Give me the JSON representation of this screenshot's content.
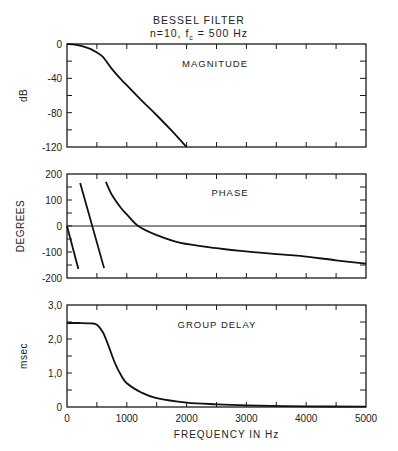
{
  "figure": {
    "title_line1": "BESSEL FILTER",
    "title_line2_prefix": "n=10,  f",
    "title_line2_sub": "c",
    "title_line2_suffix": " = 500 Hz",
    "xlabel": "FREQUENCY IN Hz"
  },
  "chart_data": [
    {
      "type": "line",
      "title": "MAGNITUDE",
      "xlabel": "FREQUENCY IN Hz",
      "ylabel": "dB",
      "xlim": [
        0,
        5000
      ],
      "ylim": [
        -120,
        0
      ],
      "x_ticks": [
        0,
        500,
        1000,
        1500,
        2000,
        2500,
        3000,
        3500,
        4000,
        4500,
        5000
      ],
      "y_tick_labels": [
        "0",
        "-40",
        "-80",
        "-120"
      ],
      "y_ticks": [
        0,
        -20,
        -40,
        -60,
        -80,
        -100,
        -120
      ],
      "grid": false,
      "series": [
        {
          "name": "Magnitude",
          "x": [
            0,
            100,
            250,
            400,
            500,
            600,
            750,
            900,
            1000,
            1250,
            1500,
            1750,
            2000
          ],
          "y": [
            0,
            -0.4,
            -2.5,
            -6,
            -10,
            -15,
            -29,
            -41,
            -48,
            -66,
            -83,
            -101,
            -120
          ]
        }
      ]
    },
    {
      "type": "line",
      "title": "PHASE",
      "ylabel": "DEGREES",
      "xlim": [
        0,
        5000
      ],
      "ylim": [
        -200,
        200
      ],
      "y_tick_labels": [
        "200",
        "100",
        "0",
        "-100",
        "-200"
      ],
      "y_ticks": [
        200,
        150,
        100,
        50,
        0,
        -50,
        -100,
        -150,
        -200
      ],
      "zero_line": true,
      "grid": false,
      "series": [
        {
          "name": "Phase segment 1",
          "x": [
            0,
            190
          ],
          "y": [
            0,
            -165
          ]
        },
        {
          "name": "Phase segment 2",
          "x": [
            220,
            620
          ],
          "y": [
            165,
            -162
          ]
        },
        {
          "name": "Phase segment 3",
          "x": [
            650,
            750,
            900,
            1000,
            1190,
            1500,
            1900,
            2500,
            2900,
            3500,
            3900,
            4500,
            5000
          ],
          "y": [
            170,
            120,
            70,
            45,
            0,
            -35,
            -65,
            -85,
            -96,
            -108,
            -115,
            -132,
            -145
          ]
        }
      ]
    },
    {
      "type": "line",
      "title": "GROUP DELAY",
      "ylabel": "msec",
      "xlabel": "FREQUENCY IN Hz",
      "xlim": [
        0,
        5000
      ],
      "ylim": [
        0,
        3.0
      ],
      "x_tick_labels": [
        "0",
        "1000",
        "2000",
        "3000",
        "4000",
        "5000"
      ],
      "y_tick_labels": [
        "3,0",
        "2,0",
        "1,0",
        "0"
      ],
      "y_ticks": [
        3.0,
        2.5,
        2.0,
        1.5,
        1.0,
        0.5,
        0
      ],
      "grid": false,
      "series": [
        {
          "name": "Group delay",
          "x": [
            0,
            200,
            400,
            500,
            600,
            690,
            800,
            900,
            1000,
            1250,
            1500,
            2000,
            2500,
            3000,
            4000,
            5000
          ],
          "y": [
            2.47,
            2.47,
            2.46,
            2.42,
            2.2,
            1.82,
            1.3,
            0.95,
            0.7,
            0.42,
            0.26,
            0.13,
            0.08,
            0.05,
            0.02,
            0.01
          ]
        }
      ]
    }
  ]
}
